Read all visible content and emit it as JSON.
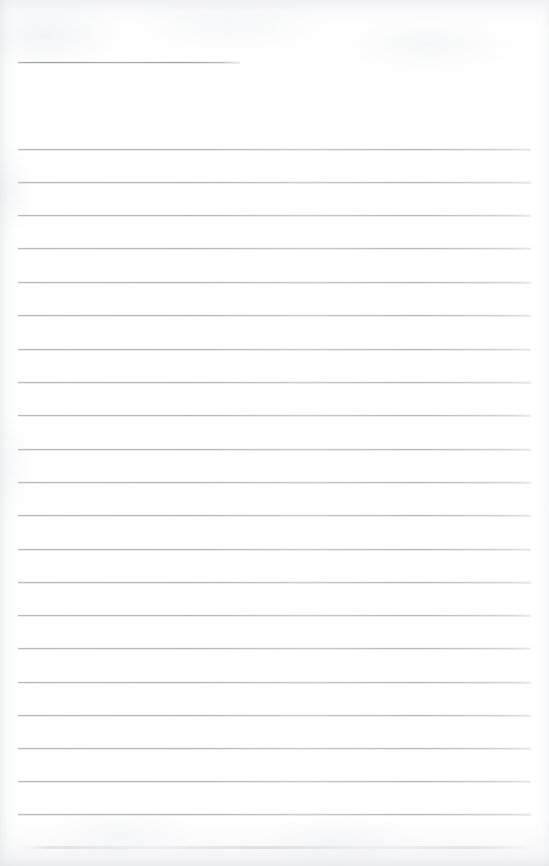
{
  "document": {
    "type": "scanned-lined-paper",
    "title": "Blank Ruled Notebook Page",
    "description": "Scanned sheet of blank ruled writing paper with no handwriting or printed text",
    "page_width": 549,
    "page_height": 866,
    "background_color": "#ffffff",
    "rule_color": "#b0b4ba",
    "text_content": "",
    "visible_text_items": []
  },
  "ruling": {
    "line_left_x": 18,
    "line_right_x": 531,
    "line_spacing": 33.2,
    "line_thickness": 1,
    "total_lines": 22,
    "lines": [
      {
        "id": "rule-0",
        "y": 62,
        "x": 18,
        "width": 222,
        "kind": "short"
      },
      {
        "id": "rule-1",
        "y": 149,
        "x": 18,
        "width": 513,
        "kind": "full"
      },
      {
        "id": "rule-2",
        "y": 182,
        "x": 18,
        "width": 513,
        "kind": "full"
      },
      {
        "id": "rule-3",
        "y": 215,
        "x": 18,
        "width": 513,
        "kind": "full"
      },
      {
        "id": "rule-4",
        "y": 248,
        "x": 18,
        "width": 513,
        "kind": "full"
      },
      {
        "id": "rule-5",
        "y": 282,
        "x": 18,
        "width": 513,
        "kind": "full"
      },
      {
        "id": "rule-6",
        "y": 315,
        "x": 18,
        "width": 513,
        "kind": "full"
      },
      {
        "id": "rule-7",
        "y": 349,
        "x": 18,
        "width": 513,
        "kind": "full"
      },
      {
        "id": "rule-8",
        "y": 382,
        "x": 18,
        "width": 513,
        "kind": "full"
      },
      {
        "id": "rule-9",
        "y": 415,
        "x": 18,
        "width": 513,
        "kind": "full"
      },
      {
        "id": "rule-10",
        "y": 449,
        "x": 18,
        "width": 513,
        "kind": "full"
      },
      {
        "id": "rule-11",
        "y": 482,
        "x": 18,
        "width": 513,
        "kind": "full"
      },
      {
        "id": "rule-12",
        "y": 515,
        "x": 18,
        "width": 513,
        "kind": "full"
      },
      {
        "id": "rule-13",
        "y": 549,
        "x": 18,
        "width": 513,
        "kind": "full"
      },
      {
        "id": "rule-14",
        "y": 582,
        "x": 18,
        "width": 513,
        "kind": "full"
      },
      {
        "id": "rule-15",
        "y": 615,
        "x": 18,
        "width": 513,
        "kind": "full"
      },
      {
        "id": "rule-16",
        "y": 648,
        "x": 18,
        "width": 513,
        "kind": "full"
      },
      {
        "id": "rule-17",
        "y": 682,
        "x": 18,
        "width": 513,
        "kind": "full"
      },
      {
        "id": "rule-18",
        "y": 715,
        "x": 18,
        "width": 513,
        "kind": "full"
      },
      {
        "id": "rule-19",
        "y": 748,
        "x": 18,
        "width": 513,
        "kind": "full"
      },
      {
        "id": "rule-20",
        "y": 781,
        "x": 18,
        "width": 513,
        "kind": "full"
      },
      {
        "id": "rule-21",
        "y": 814,
        "x": 18,
        "width": 513,
        "kind": "full"
      }
    ]
  },
  "scan_artifacts": {
    "left_edge_shadow": true,
    "right_edge_shadow": true,
    "top_edge_band": true,
    "bottom_edge_band": true,
    "paper_texture": true
  }
}
